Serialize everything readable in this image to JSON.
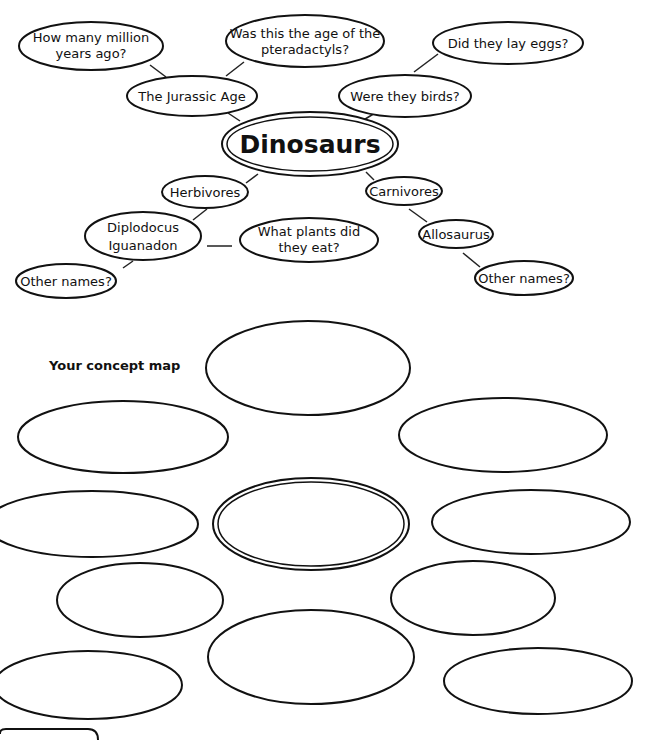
{
  "example_map": {
    "central": {
      "label": "Dinosaurs"
    },
    "nodes": [
      {
        "id": "million-years",
        "lines": [
          "How many million",
          "years ago?"
        ]
      },
      {
        "id": "pteradactyls",
        "lines": [
          "Was this the age of the",
          "pteradactyls?"
        ]
      },
      {
        "id": "lay-eggs",
        "lines": [
          "Did they lay eggs?"
        ]
      },
      {
        "id": "jurassic",
        "lines": [
          "The Jurassic Age"
        ]
      },
      {
        "id": "birds",
        "lines": [
          "Were they birds?"
        ]
      },
      {
        "id": "herbivores",
        "lines": [
          "Herbivores"
        ]
      },
      {
        "id": "carnivores",
        "lines": [
          "Carnivores"
        ]
      },
      {
        "id": "diplodocus",
        "lines": [
          "Diplodocus",
          "Iguanadon"
        ]
      },
      {
        "id": "plants",
        "lines": [
          "What plants did",
          "they eat?"
        ]
      },
      {
        "id": "allosaurus",
        "lines": [
          "Allosaurus"
        ]
      },
      {
        "id": "other-names-left",
        "lines": [
          "Other names?"
        ]
      },
      {
        "id": "other-names-right",
        "lines": [
          "Other names?"
        ]
      }
    ]
  },
  "your_map": {
    "label": "Your concept map",
    "empty_ellipse_count": 12,
    "central_ellipse_count": 1
  }
}
